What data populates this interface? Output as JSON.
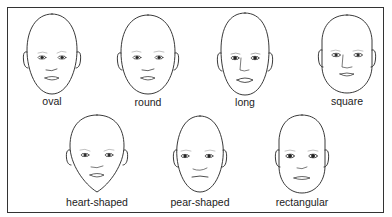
{
  "figure": {
    "type": "face-shape chart",
    "top_strip_text": "",
    "faces": [
      {
        "id": "oval",
        "label": "oval",
        "row": 1
      },
      {
        "id": "round",
        "label": "round",
        "row": 1
      },
      {
        "id": "long",
        "label": "long",
        "row": 1
      },
      {
        "id": "square",
        "label": "square",
        "row": 1
      },
      {
        "id": "heart-shaped",
        "label": "heart-shaped",
        "row": 2
      },
      {
        "id": "pear-shaped",
        "label": "pear-shaped",
        "row": 2
      },
      {
        "id": "rectangular",
        "label": "rectangular",
        "row": 2
      }
    ],
    "colors": {
      "line": "#222222",
      "frame": "#333333",
      "background": "#ffffff"
    }
  }
}
